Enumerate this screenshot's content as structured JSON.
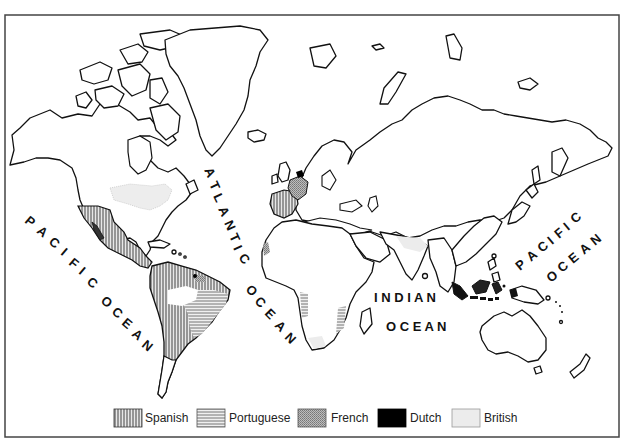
{
  "map": {
    "title": "",
    "frame": {
      "x": 5,
      "y": 15,
      "width": 614,
      "height": 422
    },
    "ocean_labels": [
      {
        "id": "pacific-west",
        "words": [
          "P",
          "A",
          "C",
          "I",
          "F",
          "I",
          "C",
          " ",
          "O",
          "C",
          "E",
          "A",
          "N"
        ],
        "text": "PACIFIC OCEAN"
      },
      {
        "id": "atlantic",
        "text": "ATLANTIC OCEAN"
      },
      {
        "id": "indian-line1",
        "text": "INDIAN"
      },
      {
        "id": "indian-line2",
        "text": "OCEAN"
      },
      {
        "id": "pacific-east-line1",
        "text": "PACIFIC"
      },
      {
        "id": "pacific-east-line2",
        "text": "OCEAN"
      }
    ],
    "pacific_west": {
      "letters": [
        "P",
        "A",
        "C",
        "I",
        "F",
        "I",
        "C",
        "O",
        "C",
        "E",
        "A",
        "N"
      ]
    },
    "atlantic": {
      "letters": [
        "A",
        "T",
        "L",
        "A",
        "N",
        "T",
        "I",
        "C",
        "O",
        "C",
        "E",
        "A",
        "N"
      ]
    },
    "indian": {
      "line1": "I N D I A N",
      "line2": "O C E A N"
    },
    "pacific_east": {
      "line1_letters": [
        "P",
        "A",
        "C",
        "I",
        "F",
        "I",
        "C"
      ],
      "line2_letters": [
        "O",
        "C",
        "E",
        "A",
        "N"
      ]
    },
    "colonial_powers": [
      {
        "name": "Spanish",
        "pattern": "vertical-hatch",
        "regions": [
          "Iberian Peninsula",
          "Mexico & Central America",
          "Western & Northern South America",
          "Caribbean",
          "Southwestern North America",
          "Philippines"
        ]
      },
      {
        "name": "Portuguese",
        "pattern": "horizontal-hatch",
        "regions": [
          "Brazil",
          "Angola coast",
          "Mozambique coast"
        ]
      },
      {
        "name": "French",
        "pattern": "dotted-grey",
        "regions": [
          "France",
          "Senegal coast",
          "Guiana"
        ]
      },
      {
        "name": "Dutch",
        "pattern": "solid-black",
        "regions": [
          "Netherlands",
          "East Indies"
        ]
      },
      {
        "name": "British",
        "pattern": "light-grey",
        "regions": [
          "Eastern North America",
          "India",
          "Cape region",
          "Britain"
        ]
      }
    ]
  },
  "legend": {
    "items": [
      {
        "label": "Spanish",
        "pattern": "spanish"
      },
      {
        "label": "Portuguese",
        "pattern": "portuguese"
      },
      {
        "label": "French",
        "pattern": "french"
      },
      {
        "label": "Dutch",
        "pattern": "dutch"
      },
      {
        "label": "British",
        "pattern": "british"
      }
    ]
  },
  "colors": {
    "ink": "#111111",
    "spanish_hatch": "#555555",
    "portuguese_hatch": "#777777",
    "french_fill": "#9a9a9a",
    "dutch_fill": "#000000",
    "british_fill": "#ececec"
  }
}
